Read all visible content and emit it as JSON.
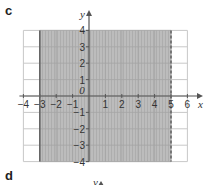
{
  "labels": {
    "part_c": "c",
    "part_d": "d",
    "next_y_axis": "y"
  },
  "chart_data": {
    "type": "region",
    "title": "",
    "xlabel": "x",
    "ylabel": "y",
    "xlim": [
      -4,
      6
    ],
    "ylim": [
      -4,
      4
    ],
    "grid": true,
    "xticks": [
      -4,
      -3,
      -2,
      -1,
      0,
      1,
      2,
      3,
      4,
      5,
      6
    ],
    "yticks": [
      -4,
      -3,
      -2,
      -1,
      1,
      2,
      3,
      4
    ],
    "xtick_labels": [
      "-4",
      "-3",
      "-2",
      "-1",
      "0",
      "1",
      "2",
      "3",
      "4",
      "5",
      "6"
    ],
    "ytick_labels": [
      "-4",
      "-3",
      "-2",
      "-1",
      "1",
      "2",
      "3",
      "4"
    ],
    "shaded_region": {
      "x_min": -3,
      "x_max": 5,
      "y_min": -4,
      "y_max": 4,
      "inequality": "-3 <= x < 5"
    },
    "boundaries": [
      {
        "x": -3,
        "style": "solid"
      },
      {
        "x": 5,
        "style": "dashed"
      }
    ],
    "colors": {
      "shade": "#b9b9b9",
      "grid": "#c8c8c8",
      "axis": "#555555",
      "boundary": "#666666"
    }
  }
}
